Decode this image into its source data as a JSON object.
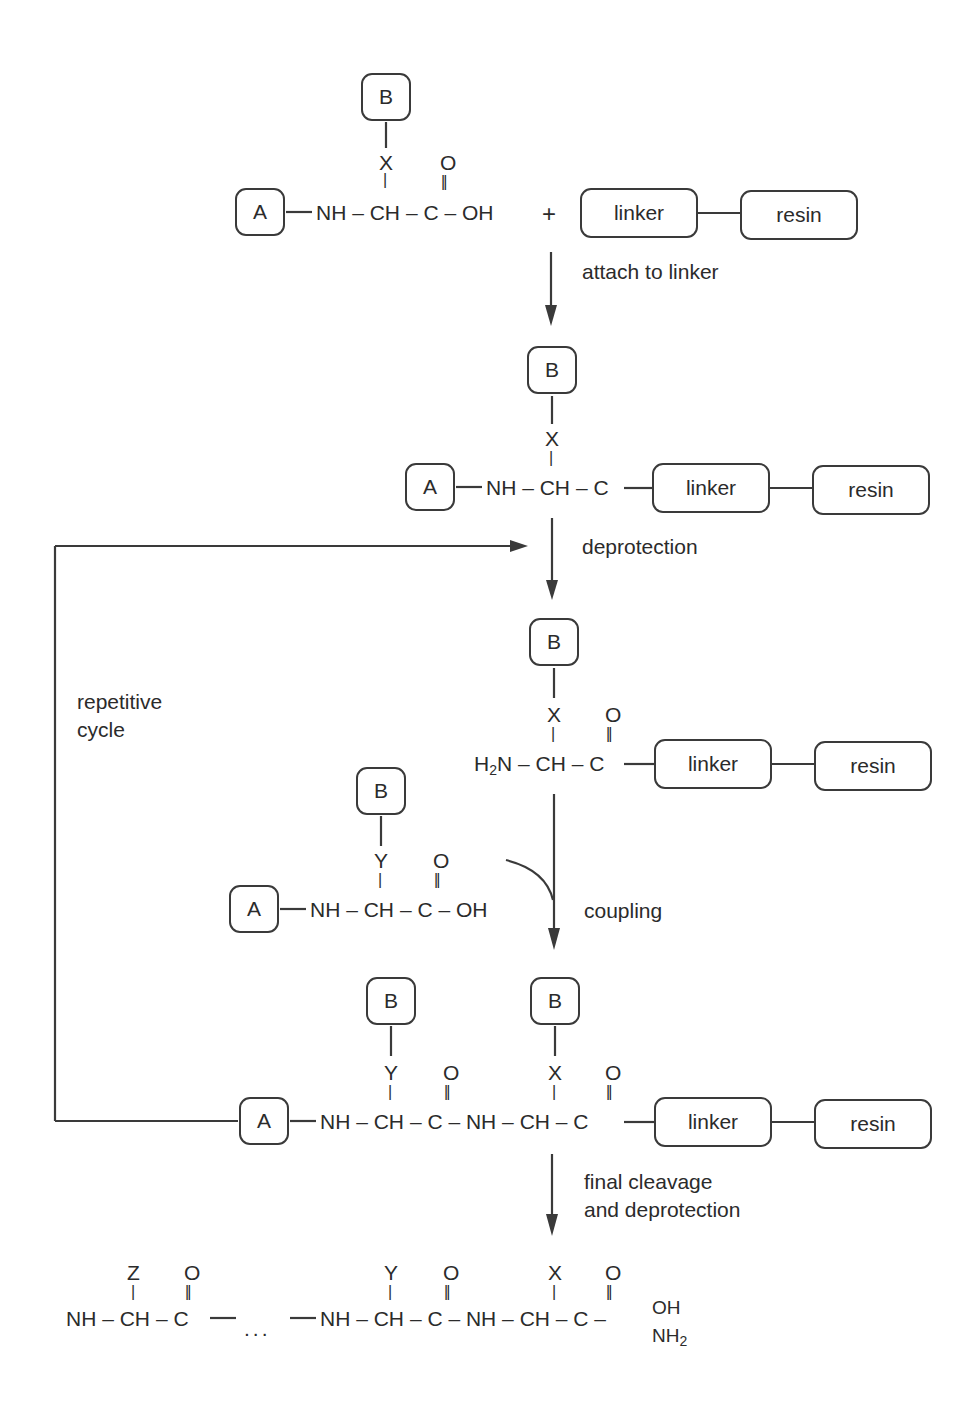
{
  "diagram": {
    "boxes": {
      "A": "A",
      "B": "B",
      "linker": "linker",
      "resin": "resin"
    },
    "atoms": {
      "NH": "NH",
      "CH": "CH",
      "C": "C",
      "OH": "OH",
      "O": "O",
      "H2N_H": "H",
      "H2N_sub": "2",
      "H2N_N": "N",
      "NH2_N": "NH",
      "NH2_sub": "2",
      "X": "X",
      "Y": "Y",
      "Z": "Z",
      "plus": "+",
      "dash": "–",
      "dots": "..."
    },
    "steps": {
      "attach": "attach to linker",
      "deprotection": "deprotection",
      "coupling": "coupling",
      "final_line1": "final cleavage",
      "final_line2": "and deprotection",
      "cycle_line1": "repetitive",
      "cycle_line2": "cycle"
    },
    "structures": [
      {
        "id": "protected-amino-acid-X",
        "formula": "A–NH–CH(X–B)–C(=O)–OH + linker–resin"
      },
      {
        "id": "anchored-amino-acid",
        "formula": "A–NH–CH(X–B)–C–linker–resin"
      },
      {
        "id": "deprotected-anchored",
        "formula": "H2N–CH(X–B)–C(=O)–linker–resin"
      },
      {
        "id": "incoming-amino-acid-Y",
        "formula": "A–NH–CH(Y–B)–C(=O)–OH"
      },
      {
        "id": "dipeptide-on-resin",
        "formula": "A–NH–CH(Y–B)–C(=O)–NH–CH(X–B)–C(=O)–linker–resin"
      },
      {
        "id": "final-peptide",
        "formula": "NH–CH(Z)–C(=O)– ... –NH–CH(Y)–C(=O)–NH–CH(X)–C(=O)–OH/NH2"
      }
    ]
  }
}
